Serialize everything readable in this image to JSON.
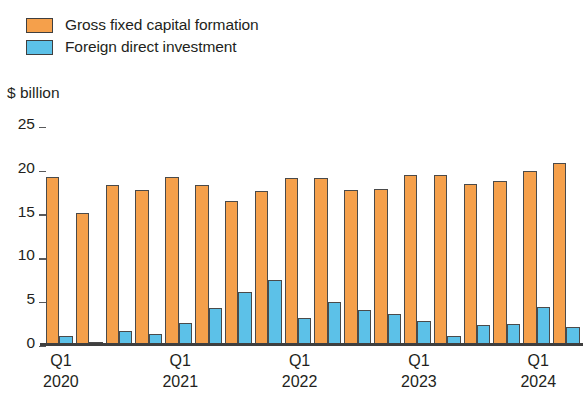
{
  "legend": {
    "items": [
      {
        "label": "Gross fixed capital formation",
        "color": "#f5a04b",
        "key": "gfcf"
      },
      {
        "label": "Foreign direct investment",
        "color": "#5cc1e8",
        "key": "fdi"
      }
    ]
  },
  "axis": {
    "unit_label": "$ billion",
    "y_ticks": [
      "0",
      "5",
      "10",
      "15",
      "20",
      "25"
    ],
    "x_group_labels": [
      {
        "quarter": "Q1",
        "year": "2020"
      },
      {
        "quarter": "Q1",
        "year": "2021"
      },
      {
        "quarter": "Q1",
        "year": "2022"
      },
      {
        "quarter": "Q1",
        "year": "2023"
      },
      {
        "quarter": "Q1",
        "year": "2024"
      }
    ]
  },
  "chart_data": {
    "type": "bar",
    "title": "",
    "subtitle": "",
    "xlabel": "",
    "ylabel": "$ billion",
    "ylim": [
      0,
      25
    ],
    "ytick_step": 5,
    "grid": false,
    "legend_position": "top-left",
    "categories": [
      "Q1 2020",
      "Q2 2020",
      "Q3 2020",
      "Q4 2020",
      "Q1 2021",
      "Q2 2021",
      "Q3 2021",
      "Q4 2021",
      "Q1 2022",
      "Q2 2022",
      "Q3 2022",
      "Q4 2022",
      "Q1 2023",
      "Q2 2023",
      "Q3 2023",
      "Q4 2023",
      "Q1 2024"
    ],
    "series": [
      {
        "name": "Gross fixed capital formation",
        "color": "#f5a04b",
        "values": [
          18.9,
          14.8,
          18.0,
          17.5,
          18.9,
          18.0,
          16.2,
          17.3,
          18.8,
          18.8,
          17.5,
          17.6,
          19.2,
          19.2,
          18.2,
          18.5,
          19.6
        ]
      },
      {
        "name": "Foreign direct investment",
        "color": "#5cc1e8",
        "values": [
          0.8,
          0.1,
          1.4,
          1.0,
          2.3,
          4.0,
          5.8,
          7.2,
          2.9,
          4.7,
          3.8,
          3.3,
          2.5,
          0.8,
          2.0,
          2.2,
          4.1
        ]
      }
    ],
    "extra_bars": [
      {
        "series": "Gross fixed capital formation",
        "value": 20.5
      },
      {
        "series": "Foreign direct investment",
        "value": 1.8
      }
    ]
  }
}
